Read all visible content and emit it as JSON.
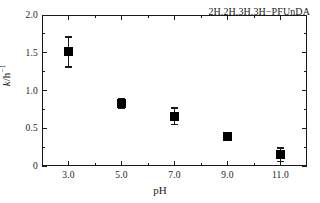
{
  "chart_data": {
    "type": "scatter",
    "title": "",
    "annotation": "2H,2H,3H,3H−PFUnDA",
    "xlabel": "pH",
    "ylabel": "k/h⁻¹",
    "ylabel_parts": {
      "symbol": "k",
      "mid": "/h",
      "exponent": "−1"
    },
    "x": [
      3.0,
      5.0,
      7.0,
      9.0,
      11.0
    ],
    "values": [
      1.51,
      0.83,
      0.66,
      0.39,
      0.15
    ],
    "yerr": [
      0.2,
      0.06,
      0.11,
      0.05,
      0.09
    ],
    "xlim": [
      2.0,
      12.0
    ],
    "ylim": [
      0.0,
      2.0
    ],
    "xticks": [
      "3.0",
      "5.0",
      "7.0",
      "9.0",
      "11.0"
    ],
    "xtick_values": [
      3.0,
      5.0,
      7.0,
      9.0,
      11.0
    ],
    "xminor_values": [
      4.0,
      6.0,
      8.0,
      10.0
    ],
    "yticks": [
      "0",
      "0.5",
      "1.0",
      "1.5",
      "2.0"
    ],
    "ytick_values": [
      0.0,
      0.5,
      1.0,
      1.5,
      2.0
    ],
    "yminor_values": [
      0.25,
      0.75,
      1.25,
      1.75
    ],
    "grid": false,
    "legend": null,
    "marker": "filled-square",
    "marker_color": "#000000",
    "axis_color": "#1a1a1a",
    "background": "#ffffff"
  }
}
